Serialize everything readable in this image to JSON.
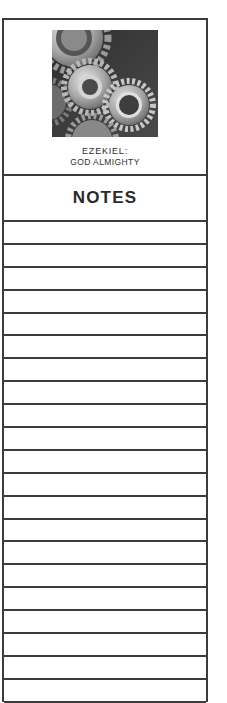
{
  "cover": {
    "image": "interlocking-gears-photo",
    "series_line1": "EZEKIEL:",
    "series_line2": "GOD ALMIGHTY"
  },
  "notes": {
    "heading": "NOTES",
    "line_count": 21
  }
}
